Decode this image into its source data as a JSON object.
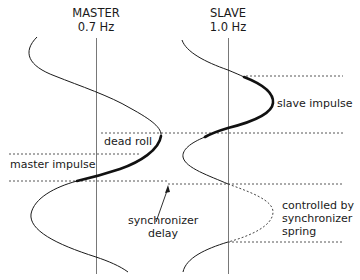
{
  "diagram": {
    "type": "waveform-comparison",
    "columns": [
      {
        "id": "master",
        "title": "MASTER",
        "frequency": "0.7 Hz"
      },
      {
        "id": "slave",
        "title": "SLAVE",
        "frequency": "1.0 Hz"
      }
    ],
    "annotations": {
      "dead_roll": "dead roll",
      "master_impulse": "master impulse",
      "slave_impulse": "slave impulse",
      "synchronizer_delay": [
        "synchronizer",
        "delay"
      ],
      "controlled_by_spring": [
        "controlled by",
        "synchronizer",
        "spring"
      ]
    },
    "colors": {
      "line": "#1a1a1a",
      "axis": "#555555",
      "dashed": "#444444"
    }
  }
}
